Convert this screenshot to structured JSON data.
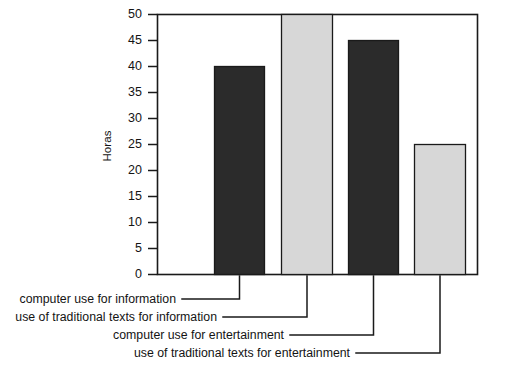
{
  "chart_data": {
    "type": "bar",
    "title": "",
    "subtitle": "",
    "xlabel": "",
    "ylabel": "Horas",
    "ylim": [
      0,
      50
    ],
    "grid": false,
    "legend_position": "below-callouts",
    "yticks": [
      0,
      5,
      10,
      15,
      20,
      25,
      30,
      35,
      40,
      45,
      50
    ],
    "ytick_labels": [
      "0",
      "5",
      "10",
      "15",
      "20",
      "25",
      "30",
      "35",
      "40",
      "45",
      "50"
    ],
    "categories": [
      "computer use for information",
      "use of traditional texts for information",
      "computer use for entertainment",
      "use of traditional texts for entertainment"
    ],
    "values": [
      40,
      50,
      45,
      25
    ],
    "bar_colors": [
      "#2b2b2b",
      "#d7d7d7",
      "#2b2b2b",
      "#d7d7d7"
    ],
    "bar_edge_color": "#1a1a1a",
    "frame_color": "#1a1a1a",
    "background": "#ffffff",
    "annotations": [
      {
        "label": "computer use for information",
        "value": 40,
        "series_color": "#2b2b2b"
      },
      {
        "label": "use of traditional texts for information",
        "value": 50,
        "series_color": "#d7d7d7"
      },
      {
        "label": "computer use for entertainment",
        "value": 45,
        "series_color": "#2b2b2b"
      },
      {
        "label": "use of traditional texts for entertainment",
        "value": 25,
        "series_color": "#d7d7d7"
      }
    ]
  },
  "axis": {
    "ylabel": "Horas",
    "ticks": {
      "t0": "0",
      "t5": "5",
      "t10": "10",
      "t15": "15",
      "t20": "20",
      "t25": "25",
      "t30": "30",
      "t35": "35",
      "t40": "40",
      "t45": "45",
      "t50": "50"
    }
  },
  "callouts": {
    "line1": "computer use for information",
    "line2": "use of traditional texts for information",
    "line3": "computer use for entertainment",
    "line4": "use of traditional texts for entertainment"
  }
}
